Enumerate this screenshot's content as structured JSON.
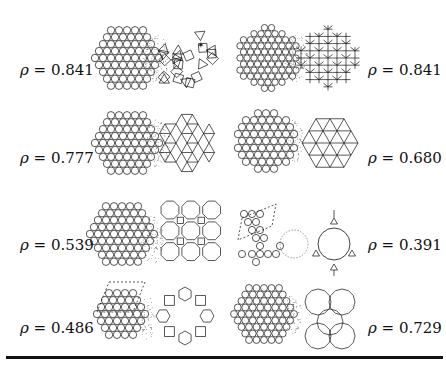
{
  "figure": {
    "symbol": "ρ",
    "equals": " = ",
    "panels": [
      {
        "id": "r1-left",
        "density": "0.841",
        "left_structure": "hexagonal disk packing",
        "right_structure": "square-triangle tiling (dodecagonal)"
      },
      {
        "id": "r1-right",
        "density": "0.841",
        "left_structure": "hexagonal disk packing",
        "right_structure": "square-triangle columnar tiling"
      },
      {
        "id": "r2-left",
        "density": "0.777",
        "left_structure": "hexagonal disk packing",
        "right_structure": "kagome/triangle network"
      },
      {
        "id": "r2-right",
        "density": "0.680",
        "left_structure": "hexagonal disk packing",
        "right_structure": "kagome lattice"
      },
      {
        "id": "r3-left",
        "density": "0.539",
        "left_structure": "disk packing",
        "right_structure": "octagon-square tiling"
      },
      {
        "id": "r3-right",
        "density": "0.391",
        "left_structure": "disk chain with rhombic unit cell",
        "right_structure": "large-ring triangle network"
      },
      {
        "id": "r4-left",
        "density": "0.486",
        "left_structure": "disk packing with rhombic unit cell",
        "right_structure": "hexagon-square ring network"
      },
      {
        "id": "r4-right",
        "density": "0.729",
        "left_structure": "hexagonal disk packing",
        "right_structure": "dodecagonal ring tiling"
      }
    ]
  },
  "colors": {
    "ink": "#111111",
    "dots": "#555555",
    "background": "#ffffff"
  }
}
